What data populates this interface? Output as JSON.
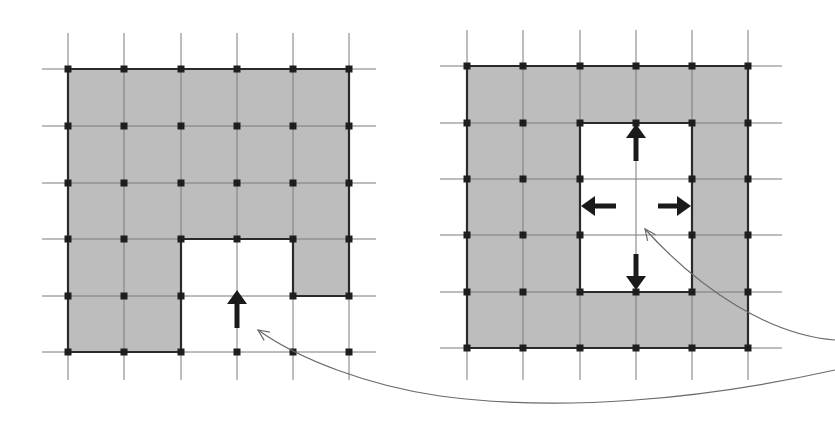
{
  "colors": {
    "background": "#ffffff",
    "cell_fill": "#bdbdbd",
    "grid_line": "#7a7a7a",
    "boundary": "#2a2a2a",
    "node": "#1e1e1e",
    "arrow": "#1a1a1a",
    "curve": "#6a6a6a"
  },
  "panels": [
    {
      "id": "left-grid",
      "xs": [
        68,
        124,
        181,
        237,
        293,
        349
      ],
      "ys": [
        69,
        126,
        183,
        239,
        296,
        352
      ],
      "x_ext": [
        42,
        376
      ],
      "y_ext": [
        33,
        380
      ],
      "filled_cells": [
        [
          0,
          0
        ],
        [
          1,
          0
        ],
        [
          2,
          0
        ],
        [
          3,
          0
        ],
        [
          4,
          0
        ],
        [
          0,
          1
        ],
        [
          1,
          1
        ],
        [
          2,
          1
        ],
        [
          3,
          1
        ],
        [
          4,
          1
        ],
        [
          0,
          2
        ],
        [
          1,
          2
        ],
        [
          2,
          2
        ],
        [
          3,
          2
        ],
        [
          4,
          2
        ],
        [
          0,
          3
        ],
        [
          1,
          3
        ],
        [
          4,
          3
        ],
        [
          0,
          4
        ],
        [
          1,
          4
        ]
      ],
      "boundary_path": [
        [
          0,
          0
        ],
        [
          5,
          0
        ],
        [
          5,
          4
        ],
        [
          4,
          4
        ],
        [
          4,
          3
        ],
        [
          2,
          3
        ],
        [
          2,
          5
        ],
        [
          0,
          5
        ]
      ],
      "nodes": [
        [
          0,
          0
        ],
        [
          1,
          0
        ],
        [
          2,
          0
        ],
        [
          3,
          0
        ],
        [
          4,
          0
        ],
        [
          5,
          0
        ],
        [
          0,
          1
        ],
        [
          1,
          1
        ],
        [
          2,
          1
        ],
        [
          3,
          1
        ],
        [
          4,
          1
        ],
        [
          5,
          1
        ],
        [
          0,
          2
        ],
        [
          1,
          2
        ],
        [
          2,
          2
        ],
        [
          3,
          2
        ],
        [
          4,
          2
        ],
        [
          5,
          2
        ],
        [
          0,
          3
        ],
        [
          1,
          3
        ],
        [
          2,
          3
        ],
        [
          3,
          3
        ],
        [
          4,
          3
        ],
        [
          5,
          3
        ],
        [
          0,
          4
        ],
        [
          1,
          4
        ],
        [
          2,
          4
        ],
        [
          4,
          4
        ],
        [
          5,
          4
        ],
        [
          0,
          5
        ],
        [
          1,
          5
        ],
        [
          2,
          5
        ],
        [
          3,
          5
        ],
        [
          4,
          5
        ],
        [
          5,
          5
        ]
      ],
      "arrows": [
        {
          "name": "up-arrow",
          "from": [
            237,
            328
          ],
          "to": [
            237,
            290
          ]
        }
      ]
    },
    {
      "id": "right-grid",
      "xs": [
        467,
        523,
        580,
        636,
        692,
        748
      ],
      "ys": [
        66,
        123,
        179,
        235,
        292,
        348
      ],
      "x_ext": [
        440,
        782
      ],
      "y_ext": [
        30,
        380
      ],
      "filled_cells": [
        [
          0,
          0
        ],
        [
          1,
          0
        ],
        [
          2,
          0
        ],
        [
          3,
          0
        ],
        [
          4,
          0
        ],
        [
          0,
          1
        ],
        [
          1,
          1
        ],
        [
          4,
          1
        ],
        [
          0,
          2
        ],
        [
          1,
          2
        ],
        [
          4,
          2
        ],
        [
          0,
          3
        ],
        [
          1,
          3
        ],
        [
          4,
          3
        ],
        [
          0,
          4
        ],
        [
          1,
          4
        ],
        [
          2,
          4
        ],
        [
          3,
          4
        ],
        [
          4,
          4
        ]
      ],
      "boundary_path": [
        [
          0,
          0
        ],
        [
          5,
          0
        ],
        [
          5,
          5
        ],
        [
          0,
          5
        ]
      ],
      "hole_path": [
        [
          2,
          1
        ],
        [
          4,
          1
        ],
        [
          4,
          4
        ],
        [
          2,
          4
        ]
      ],
      "nodes": [
        [
          0,
          0
        ],
        [
          1,
          0
        ],
        [
          2,
          0
        ],
        [
          3,
          0
        ],
        [
          4,
          0
        ],
        [
          5,
          0
        ],
        [
          0,
          1
        ],
        [
          1,
          1
        ],
        [
          2,
          1
        ],
        [
          3,
          1
        ],
        [
          4,
          1
        ],
        [
          5,
          1
        ],
        [
          0,
          2
        ],
        [
          1,
          2
        ],
        [
          2,
          2
        ],
        [
          4,
          2
        ],
        [
          5,
          2
        ],
        [
          0,
          3
        ],
        [
          1,
          3
        ],
        [
          2,
          3
        ],
        [
          4,
          3
        ],
        [
          5,
          3
        ],
        [
          0,
          4
        ],
        [
          1,
          4
        ],
        [
          2,
          4
        ],
        [
          3,
          4
        ],
        [
          4,
          4
        ],
        [
          5,
          4
        ],
        [
          0,
          5
        ],
        [
          1,
          5
        ],
        [
          2,
          5
        ],
        [
          3,
          5
        ],
        [
          4,
          5
        ],
        [
          5,
          5
        ]
      ],
      "arrows": [
        {
          "name": "up-arrow",
          "from": [
            636,
            161
          ],
          "to": [
            636,
            124
          ]
        },
        {
          "name": "left-arrow",
          "from": [
            616,
            206
          ],
          "to": [
            581,
            206
          ]
        },
        {
          "name": "right-arrow",
          "from": [
            658,
            206
          ],
          "to": [
            691,
            206
          ]
        },
        {
          "name": "down-arrow",
          "from": [
            636,
            254
          ],
          "to": [
            636,
            290
          ]
        }
      ]
    }
  ],
  "curves": [
    {
      "name": "curve-to-right-hole",
      "d": "M 835 340 C 770 335, 700 290, 645 229",
      "head": [
        645,
        229
      ],
      "head_dir": [
        -0.6,
        -0.8
      ]
    },
    {
      "name": "curve-to-left-gap",
      "d": "M 835 370 C 700 400, 560 412, 440 396 C 370 386, 300 360, 258 330",
      "head": [
        258,
        330
      ],
      "head_dir": [
        -0.82,
        -0.57
      ]
    }
  ]
}
